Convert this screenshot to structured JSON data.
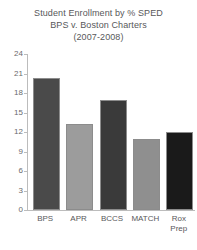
{
  "chart_data": {
    "type": "bar",
    "title": "Student Enrollment by % SPED",
    "subtitle": "BPS v. Boston Charters",
    "period": "(2007-2008)",
    "title_lines": [
      "Student Enrollment by % SPED",
      "BPS v. Boston Charters",
      "(2007-2008)"
    ],
    "categories": [
      "BPS",
      "APR",
      "BCCS",
      "MATCH",
      "Rox\nPrep"
    ],
    "category_labels": [
      "BPS",
      "APR",
      "BCCS",
      "MATCH",
      "Rox Prep"
    ],
    "values": [
      20.3,
      13.3,
      17,
      11,
      12
    ],
    "xlabel": "",
    "ylabel": "",
    "ylim": [
      0,
      24
    ],
    "yticks": [
      0,
      3,
      6,
      9,
      12,
      15,
      18,
      21,
      24
    ],
    "ytick_labels": [
      "0",
      "3",
      "6",
      "9",
      "12",
      "15",
      "18",
      "21",
      "24"
    ],
    "grid": false,
    "legend": false,
    "bar_colors": [
      "#4a4a4a",
      "#9c9c9c",
      "#3a3a3a",
      "#8f8f8f",
      "#1a1a1a"
    ],
    "bar_edge_color": "#8c8c8c",
    "axis_color": "#bcbcbc",
    "text_color": "#58585a",
    "background": "#ffffff"
  }
}
